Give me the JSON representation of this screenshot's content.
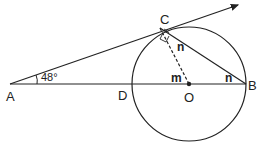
{
  "diagram": {
    "type": "geometry",
    "points": {
      "A": {
        "label": "A",
        "x": 10,
        "y": 84
      },
      "C": {
        "label": "C",
        "x": 160,
        "y": 28
      },
      "D": {
        "label": "D",
        "x": 132,
        "y": 84
      },
      "O": {
        "label": "O",
        "x": 189,
        "y": 84
      },
      "B": {
        "label": "B",
        "x": 246,
        "y": 84
      }
    },
    "circle": {
      "center": "O",
      "radius": 57
    },
    "angles": {
      "A": "48°",
      "OCB": "n",
      "OBC": "n",
      "COD": "m",
      "ACO": "right-angle"
    },
    "labels": {
      "A": "A",
      "B": "B",
      "C": "C",
      "D": "D",
      "O": "O",
      "angle_A": "48°",
      "n1": "n",
      "n2": "n",
      "m": "m"
    },
    "colors": {
      "stroke": "#222222",
      "background": "#ffffff"
    }
  }
}
